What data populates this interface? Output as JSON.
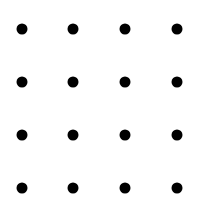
{
  "diagram": {
    "type": "dot-grid",
    "rows": 4,
    "columns": 4,
    "dot_color": "#000000",
    "background": "#ffffff",
    "dot_diameter": 11,
    "column_x": [
      22,
      73,
      125,
      177
    ],
    "row_y": [
      29,
      82,
      135,
      188
    ]
  }
}
